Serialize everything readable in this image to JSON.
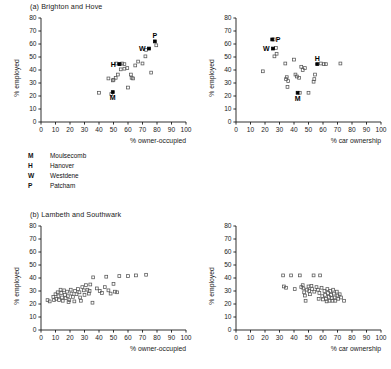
{
  "figure": {
    "background": "#ffffff",
    "axis_color": "#1a1a1a",
    "marker_open_color": "#555555",
    "marker_filled_color": "#000000"
  },
  "panels": [
    {
      "id": "a-left",
      "title": "(a) Brighton and Hove",
      "chart_index": 0
    },
    {
      "id": "a-right",
      "title": "",
      "chart_index": 1
    },
    {
      "id": "b-left",
      "title": "(b) Lambeth and Southwark",
      "chart_index": 2
    },
    {
      "id": "b-right",
      "title": "",
      "chart_index": 3
    }
  ],
  "legend": {
    "title": "",
    "items": [
      {
        "key": "M",
        "label": "Moulsecomb"
      },
      {
        "key": "H",
        "label": "Hanover"
      },
      {
        "key": "W",
        "label": "Westdene"
      },
      {
        "key": "P",
        "label": "Patcham"
      }
    ]
  },
  "bottom_cut_text": "",
  "chart_data": [
    {
      "type": "scatter",
      "title": "(a) Brighton and Hove",
      "xlabel": "% owner-occupied",
      "ylabel": "% employed",
      "xlim": [
        0,
        100
      ],
      "ylim": [
        0,
        80
      ],
      "xticks": [
        0,
        10,
        20,
        30,
        40,
        50,
        60,
        70,
        80,
        90,
        100
      ],
      "yticks": [
        0,
        10,
        20,
        30,
        40,
        50,
        60,
        70,
        80
      ],
      "grid": false,
      "legend_position": "below-plot",
      "series": [
        {
          "name": "wards (unlabelled)",
          "marker": "open-square",
          "points": [
            [
              40.0,
              22.5
            ],
            [
              48.5,
              21.5
            ],
            [
              49.5,
              32.0
            ],
            [
              51.5,
              34.0
            ],
            [
              53.0,
              36.5
            ],
            [
              52.0,
              45.0
            ],
            [
              56.0,
              45.0
            ],
            [
              57.5,
              44.5
            ],
            [
              55.0,
              40.5
            ],
            [
              57.5,
              41.0
            ],
            [
              59.5,
              41.5
            ],
            [
              62.0,
              36.5
            ],
            [
              62.5,
              34.0
            ],
            [
              63.5,
              33.5
            ],
            [
              60.0,
              26.5
            ],
            [
              65.0,
              43.5
            ],
            [
              67.0,
              46.5
            ],
            [
              70.0,
              45.0
            ],
            [
              72.0,
              50.5
            ],
            [
              72.5,
              55.5
            ],
            [
              76.0,
              38.0
            ],
            [
              79.5,
              59.0
            ],
            [
              54.5,
              44.5
            ],
            [
              50.0,
              32.5
            ],
            [
              46.5,
              33.5
            ]
          ]
        },
        {
          "name": "highlighted wards",
          "marker": "filled-square",
          "points": [
            [
              49.5,
              23.0
            ],
            [
              54.0,
              44.5
            ],
            [
              74.5,
              56.5
            ],
            [
              78.5,
              62.0
            ]
          ],
          "labels": [
            "M",
            "H",
            "W",
            "P"
          ],
          "label_positions": [
            "below",
            "left",
            "left",
            "above"
          ]
        }
      ]
    },
    {
      "type": "scatter",
      "title": "",
      "xlabel": "% car ownership",
      "ylabel": "% employed",
      "xlim": [
        0,
        100
      ],
      "ylim": [
        0,
        80
      ],
      "xticks": [
        0,
        10,
        20,
        30,
        40,
        50,
        60,
        70,
        80,
        90,
        100
      ],
      "yticks": [
        0,
        10,
        20,
        30,
        40,
        50,
        60,
        70,
        80
      ],
      "grid": false,
      "legend_position": "none",
      "series": [
        {
          "name": "wards (unlabelled)",
          "marker": "open-square",
          "points": [
            [
              18.5,
              39.0
            ],
            [
              26.0,
              63.5
            ],
            [
              27.5,
              57.0
            ],
            [
              26.5,
              50.5
            ],
            [
              28.0,
              52.5
            ],
            [
              34.0,
              45.0
            ],
            [
              35.0,
              34.5
            ],
            [
              34.5,
              33.0
            ],
            [
              36.0,
              31.5
            ],
            [
              35.5,
              27.0
            ],
            [
              40.0,
              48.0
            ],
            [
              41.0,
              36.5
            ],
            [
              42.0,
              35.0
            ],
            [
              43.5,
              34.0
            ],
            [
              45.0,
              42.5
            ],
            [
              46.0,
              40.0
            ],
            [
              47.5,
              41.5
            ],
            [
              44.0,
              22.5
            ],
            [
              50.0,
              22.5
            ],
            [
              54.5,
              36.5
            ],
            [
              54.0,
              33.0
            ],
            [
              53.5,
              31.0
            ],
            [
              58.5,
              45.0
            ],
            [
              60.5,
              44.5
            ],
            [
              62.0,
              44.5
            ],
            [
              72.0,
              45.0
            ]
          ]
        },
        {
          "name": "highlighted wards",
          "marker": "filled-square",
          "points": [
            [
              42.5,
              22.5
            ],
            [
              56.0,
              44.5
            ],
            [
              25.5,
              56.5
            ],
            [
              25.0,
              63.5
            ]
          ],
          "labels": [
            "M",
            "H",
            "W",
            "P"
          ],
          "label_positions": [
            "below",
            "above",
            "left",
            "right"
          ]
        }
      ]
    },
    {
      "type": "scatter",
      "title": "(b) Lambeth and Southwark",
      "xlabel": "% owner-occupied",
      "ylabel": "% employed",
      "xlim": [
        0,
        100
      ],
      "ylim": [
        0,
        80
      ],
      "xticks": [
        0,
        10,
        20,
        30,
        40,
        50,
        60,
        70,
        80,
        90,
        100
      ],
      "yticks": [
        0,
        10,
        20,
        30,
        40,
        50,
        60,
        70,
        80
      ],
      "grid": false,
      "legend_position": "none",
      "series": [
        {
          "name": "wards",
          "marker": "open-square",
          "points": [
            [
              4.5,
              23.0
            ],
            [
              6.0,
              22.0
            ],
            [
              8.5,
              25.5
            ],
            [
              9.0,
              23.0
            ],
            [
              10.0,
              27.5
            ],
            [
              10.5,
              24.0
            ],
            [
              11.5,
              29.0
            ],
            [
              12.0,
              26.0
            ],
            [
              12.5,
              23.0
            ],
            [
              13.5,
              31.0
            ],
            [
              14.0,
              28.5
            ],
            [
              14.5,
              25.0
            ],
            [
              15.0,
              22.5
            ],
            [
              16.0,
              30.5
            ],
            [
              16.5,
              27.0
            ],
            [
              17.0,
              24.5
            ],
            [
              18.0,
              29.5
            ],
            [
              18.5,
              26.0
            ],
            [
              19.5,
              23.0
            ],
            [
              20.5,
              31.0
            ],
            [
              21.0,
              28.0
            ],
            [
              22.0,
              25.5
            ],
            [
              23.5,
              30.0
            ],
            [
              24.5,
              27.5
            ],
            [
              25.5,
              31.5
            ],
            [
              26.5,
              29.0
            ],
            [
              27.0,
              25.0
            ],
            [
              28.5,
              33.0
            ],
            [
              29.5,
              30.5
            ],
            [
              30.0,
              27.0
            ],
            [
              31.0,
              34.5
            ],
            [
              32.0,
              31.0
            ],
            [
              33.0,
              28.0
            ],
            [
              35.5,
              21.0
            ],
            [
              36.0,
              40.5
            ],
            [
              38.5,
              32.0
            ],
            [
              40.5,
              30.0
            ],
            [
              42.0,
              28.5
            ],
            [
              44.0,
              33.0
            ],
            [
              45.0,
              41.0
            ],
            [
              46.5,
              30.5
            ],
            [
              48.0,
              28.0
            ],
            [
              50.0,
              35.5
            ],
            [
              51.0,
              29.5
            ],
            [
              52.5,
              29.0
            ],
            [
              54.0,
              41.5
            ],
            [
              60.0,
              41.5
            ],
            [
              65.5,
              42.0
            ],
            [
              72.5,
              42.5
            ],
            [
              34.0,
              35.0
            ],
            [
              33.5,
              30.0
            ],
            [
              27.5,
              22.5
            ],
            [
              23.0,
              22.0
            ],
            [
              19.0,
              21.5
            ]
          ]
        }
      ]
    },
    {
      "type": "scatter",
      "title": "",
      "xlabel": "% car ownership",
      "ylabel": "% employed",
      "xlim": [
        0,
        100
      ],
      "ylim": [
        0,
        80
      ],
      "xticks": [
        0,
        10,
        20,
        30,
        40,
        50,
        60,
        70,
        80,
        90,
        100
      ],
      "yticks": [
        0,
        10,
        20,
        30,
        40,
        50,
        60,
        70,
        80
      ],
      "grid": false,
      "legend_position": "none",
      "series": [
        {
          "name": "wards",
          "marker": "open-square",
          "points": [
            [
              32.5,
              42.0
            ],
            [
              33.0,
              33.5
            ],
            [
              34.5,
              32.5
            ],
            [
              38.0,
              42.0
            ],
            [
              40.5,
              31.5
            ],
            [
              44.0,
              42.0
            ],
            [
              45.0,
              33.0
            ],
            [
              46.0,
              34.5
            ],
            [
              46.5,
              32.0
            ],
            [
              47.0,
              29.0
            ],
            [
              47.5,
              26.5
            ],
            [
              48.0,
              22.5
            ],
            [
              49.0,
              31.0
            ],
            [
              50.0,
              33.5
            ],
            [
              50.5,
              30.0
            ],
            [
              51.0,
              27.5
            ],
            [
              52.0,
              34.0
            ],
            [
              52.5,
              31.5
            ],
            [
              53.5,
              42.0
            ],
            [
              54.0,
              29.5
            ],
            [
              55.5,
              33.0
            ],
            [
              56.5,
              31.0
            ],
            [
              57.5,
              28.5
            ],
            [
              58.0,
              42.0
            ],
            [
              59.0,
              32.5
            ],
            [
              59.5,
              26.0
            ],
            [
              60.0,
              23.5
            ],
            [
              61.0,
              30.0
            ],
            [
              61.5,
              27.0
            ],
            [
              62.0,
              24.0
            ],
            [
              63.0,
              31.5
            ],
            [
              63.5,
              28.5
            ],
            [
              64.0,
              25.5
            ],
            [
              64.5,
              22.5
            ],
            [
              65.0,
              30.0
            ],
            [
              65.5,
              27.0
            ],
            [
              66.0,
              24.5
            ],
            [
              67.0,
              31.0
            ],
            [
              67.5,
              28.0
            ],
            [
              68.0,
              25.0
            ],
            [
              68.5,
              22.5
            ],
            [
              69.5,
              29.5
            ],
            [
              70.0,
              26.5
            ],
            [
              70.5,
              24.0
            ],
            [
              71.5,
              27.5
            ],
            [
              72.5,
              25.0
            ],
            [
              74.5,
              22.5
            ],
            [
              57.0,
              24.0
            ],
            [
              62.5,
              22.0
            ],
            [
              66.5,
              22.5
            ]
          ]
        }
      ]
    }
  ]
}
